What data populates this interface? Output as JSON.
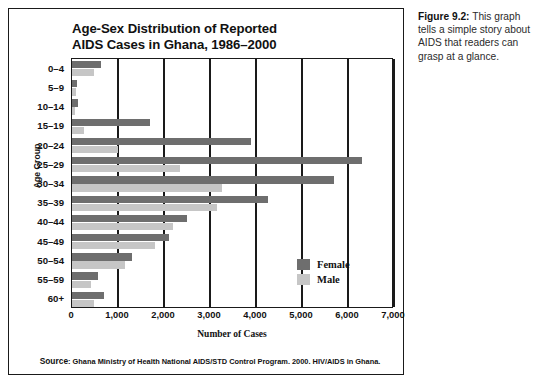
{
  "caption": {
    "figure_number": "Figure 9.2:",
    "text": " This graph tells a simple story about AIDS that readers can grasp at a glance."
  },
  "source": {
    "label": "Source",
    "separator": ":",
    "text": " Ghana Ministry of Health National AIDS/STD Control Program. 2000. HIV/AIDS in Ghana."
  },
  "legend": {
    "female_label": "Female",
    "male_label": "Male",
    "female_color": "#6e6e6e",
    "male_color": "#c6c6c6"
  },
  "chart_data": {
    "type": "bar",
    "orientation": "horizontal",
    "title": "Age-Sex Distribution of Reported AIDS Cases in Ghana, 1986–2000",
    "title_line1": "Age-Sex Distribution of Reported",
    "title_line2": "AIDS Cases in Ghana, 1986–2000",
    "xlabel": "Number of Cases",
    "ylabel": "Age Group",
    "xlim": [
      0,
      7000
    ],
    "xticks": [
      0,
      1000,
      2000,
      3000,
      4000,
      5000,
      6000,
      7000
    ],
    "xticklabels": [
      "0",
      "1,000",
      "2,000",
      "3,000",
      "4,000",
      "5,000",
      "6,000",
      "7,000"
    ],
    "grid": true,
    "legend_position": "center-right",
    "categories": [
      "0–4",
      "5–9",
      "10–14",
      "15–19",
      "20–24",
      "25–29",
      "30–34",
      "35–39",
      "40–44",
      "45–49",
      "50–54",
      "55–59",
      "60+"
    ],
    "series": [
      {
        "name": "Female",
        "color": "#6e6e6e",
        "values": [
          620,
          110,
          120,
          1700,
          3900,
          6300,
          5700,
          4250,
          2500,
          2100,
          1300,
          560,
          700
        ]
      },
      {
        "name": "Male",
        "color": "#c6c6c6",
        "values": [
          480,
          90,
          70,
          250,
          1000,
          2350,
          3250,
          3150,
          2200,
          1800,
          1150,
          420,
          480
        ]
      }
    ]
  }
}
